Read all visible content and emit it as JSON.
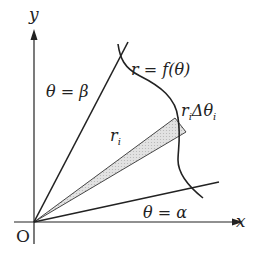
{
  "diagram": {
    "axes": {
      "x_label": "x",
      "y_label": "y",
      "origin_label": "O"
    },
    "labels": {
      "curve": "r = f(θ)",
      "ray_beta": "θ = β",
      "ray_alpha": "θ = α",
      "radius": "r",
      "radius_sub": "i",
      "arc_r": "r",
      "arc_r_sub": "i",
      "arc_delta": "Δθ",
      "arc_delta_sub": "i"
    },
    "colors": {
      "stroke": "#222222",
      "wedge_fill": "#d8d8d8",
      "background": "#ffffff"
    }
  }
}
